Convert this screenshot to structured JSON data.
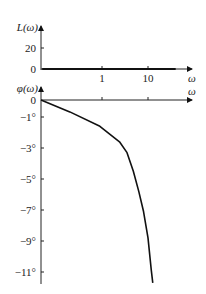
{
  "chart_data": [
    {
      "type": "line",
      "title": "",
      "ylabel": "L(ω)",
      "xlabel": "ω",
      "xscale": "log",
      "xticks": [
        1,
        10
      ],
      "xtick_labels": [
        "1",
        "10"
      ],
      "yticks": [
        0,
        20
      ],
      "ytick_labels": [
        "0",
        "20"
      ],
      "series": [
        {
          "name": "L(ω)",
          "x": [
            0.05,
            40
          ],
          "y": [
            0,
            0
          ]
        }
      ]
    },
    {
      "type": "line",
      "title": "",
      "ylabel": "φ(ω)",
      "xlabel": "ω",
      "xscale": "log",
      "xticks": [
        1,
        10
      ],
      "yticks": [
        0,
        -1,
        -3,
        -5,
        -7,
        -9,
        -11
      ],
      "ytick_labels": [
        "0",
        "−1°",
        "−3°",
        "−5°",
        "−7°",
        "−9°",
        "−11°"
      ],
      "ylim": [
        -11.7,
        0
      ],
      "series": [
        {
          "name": "φ(ω)",
          "x": [
            0.047,
            0.2,
            0.9,
            2.4,
            3.5,
            4.8,
            6.3,
            8.0,
            10.0,
            11.8,
            12.7
          ],
          "y": [
            0,
            -0.7,
            -1.6,
            -2.6,
            -3.3,
            -4.5,
            -5.8,
            -7.1,
            -8.8,
            -10.9,
            -11.7
          ]
        }
      ]
    }
  ],
  "labels": {
    "L_axis": "L(ω)",
    "phi_axis": "φ(ω)",
    "omega": "ω"
  }
}
